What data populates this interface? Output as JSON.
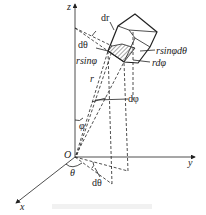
{
  "diagram": {
    "axes": {
      "x": "x",
      "y": "y",
      "z": "z",
      "origin": "O"
    },
    "labels": {
      "dr": "dr",
      "dtheta_top": "dθ",
      "rsinphi": "rsinφ",
      "rsinphidtheta": "rsinφdθ",
      "rdphi": "rdφ",
      "r": "r",
      "dphi": "dφ",
      "phi": "φ",
      "theta": "θ",
      "dtheta_bottom": "dθ"
    },
    "colors": {
      "line": "#222222",
      "background": "#ffffff"
    }
  }
}
